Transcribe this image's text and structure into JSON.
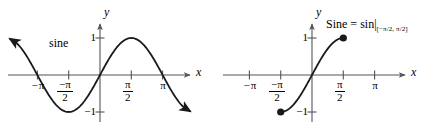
{
  "figure": {
    "background": "#ffffff",
    "stroke_color": "#1a1a1a",
    "axis_color": "#555555",
    "panels": [
      {
        "id": "left",
        "curve_label": "sine",
        "axis_x_label": "x",
        "axis_y_label": "y",
        "x_ticks": [
          {
            "label_text": "−π",
            "kind": "plain",
            "value": -3.14159
          },
          {
            "label_text": "−π/2",
            "kind": "fraction",
            "numerator": "−π",
            "denominator": "2",
            "value": -1.5708
          },
          {
            "label_text": "π/2",
            "kind": "fraction",
            "numerator": "π",
            "denominator": "2",
            "value": 1.5708
          },
          {
            "label_text": "π",
            "kind": "plain",
            "value": 3.14159
          }
        ],
        "y_ticks": [
          {
            "label_text": "1",
            "value": 1
          },
          {
            "label_text": "−1",
            "value": -1
          }
        ],
        "curve": {
          "function": "sin",
          "domain_shown": [
            -4.2,
            4.2
          ],
          "arrowheads": [
            "start",
            "end"
          ],
          "endpoint_dots": []
        }
      },
      {
        "id": "right",
        "curve_label": "",
        "axis_x_label": "x",
        "axis_y_label": "y",
        "formula": {
          "name": "Sine",
          "equals": "=",
          "base": "sin",
          "restriction": "[−π/2, π/2]"
        },
        "x_ticks": [
          {
            "label_text": "−π",
            "kind": "plain",
            "value": -3.14159
          },
          {
            "label_text": "−π/2",
            "kind": "fraction",
            "numerator": "−π",
            "denominator": "2",
            "value": -1.5708
          },
          {
            "label_text": "π/2",
            "kind": "fraction",
            "numerator": "π",
            "denominator": "2",
            "value": 1.5708
          },
          {
            "label_text": "π",
            "kind": "plain",
            "value": 3.14159
          }
        ],
        "y_ticks": [
          {
            "label_text": "1",
            "value": 1
          },
          {
            "label_text": "−1",
            "value": -1
          }
        ],
        "curve": {
          "function": "sin",
          "domain_shown": [
            -1.5708,
            1.5708
          ],
          "arrowheads": [],
          "endpoint_dots": [
            {
              "x": -1.5708,
              "y": -1
            },
            {
              "x": 1.5708,
              "y": 1
            }
          ]
        }
      }
    ]
  },
  "chart_data": {
    "type": "line",
    "title": "",
    "xlabel": "x",
    "ylabel": "y",
    "grid": false,
    "legend": "none",
    "charts": [
      {
        "name": "sine",
        "subtitle": "sine",
        "type": "line",
        "xlim": [
          -4.2,
          4.2
        ],
        "ylim": [
          -1.45,
          1.45
        ],
        "xticks": [
          -3.14159,
          -1.5708,
          1.5708,
          3.14159
        ],
        "xticklabels": [
          "−π",
          "−π/2",
          "π/2",
          "π"
        ],
        "yticks": [
          -1,
          1
        ],
        "yticklabels": [
          "−1",
          "1"
        ],
        "series": [
          {
            "name": "sin(x)",
            "expression": "y = sin(x)",
            "x": [
              -4.2,
              -3.665,
              -3.14159,
              -2.618,
              -2.0944,
              -1.5708,
              -1.0472,
              -0.5236,
              0,
              0.5236,
              1.0472,
              1.5708,
              2.0944,
              2.618,
              3.14159,
              3.665,
              4.2
            ],
            "y": [
              0.8716,
              0.5,
              0,
              -0.5,
              -0.866,
              -1,
              -0.866,
              -0.5,
              0,
              0.5,
              0.866,
              1,
              0.866,
              0.5,
              0,
              -0.5,
              -0.8716
            ]
          }
        ]
      },
      {
        "name": "Sine",
        "subtitle": "Sine = sin|[−π/2, π/2]",
        "type": "line",
        "xlim": [
          -4.2,
          4.2
        ],
        "ylim": [
          -1.45,
          1.45
        ],
        "xticks": [
          -3.14159,
          -1.5708,
          1.5708,
          3.14159
        ],
        "xticklabels": [
          "−π",
          "−π/2",
          "π/2",
          "π"
        ],
        "yticks": [
          -1,
          1
        ],
        "yticklabels": [
          "−1",
          "1"
        ],
        "series": [
          {
            "name": "Sine(x)",
            "expression": "y = sin(x), x ∈ [−π/2, π/2]",
            "x": [
              -1.5708,
              -1.309,
              -1.0472,
              -0.7854,
              -0.5236,
              -0.2618,
              0,
              0.2618,
              0.5236,
              0.7854,
              1.0472,
              1.309,
              1.5708
            ],
            "y": [
              -1,
              -0.9659,
              -0.866,
              -0.7071,
              -0.5,
              -0.2588,
              0,
              0.2588,
              0.5,
              0.7071,
              0.866,
              0.9659,
              1
            ],
            "endpoints_closed": [
              [
                -1.5708,
                -1
              ],
              [
                1.5708,
                1
              ]
            ]
          }
        ]
      }
    ]
  }
}
